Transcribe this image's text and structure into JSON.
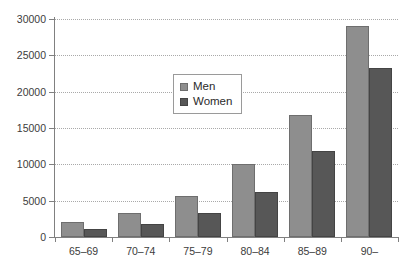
{
  "chart_data": {
    "type": "bar",
    "title": "",
    "subtitle": "",
    "xlabel": "",
    "ylabel": "",
    "categories": [
      "65–69",
      "70–74",
      "75–79",
      "80–84",
      "85–89",
      "90–"
    ],
    "series": [
      {
        "name": "Men",
        "color": "#8e8e8e",
        "values": [
          2100,
          3300,
          5700,
          10100,
          16800,
          29000
        ]
      },
      {
        "name": "Women",
        "color": "#575757",
        "values": [
          1100,
          1800,
          3300,
          6200,
          11800,
          23300
        ]
      }
    ],
    "ylim": [
      0,
      30000
    ],
    "yticks": [
      0,
      5000,
      10000,
      15000,
      20000,
      25000,
      30000
    ],
    "ytick_labels": [
      "0",
      "5000",
      "10000",
      "15000",
      "20000",
      "25000",
      "30000"
    ],
    "grid": true,
    "grid_style": "dotted",
    "grid_color": "#a9a9a9",
    "legend": {
      "position": "upper-center",
      "entries": [
        {
          "label": "Men",
          "swatch_color": "#8e8e8e"
        },
        {
          "label": "Women",
          "swatch_color": "#575757"
        }
      ]
    },
    "axis_color": "#808080",
    "background": "#ffffff"
  }
}
